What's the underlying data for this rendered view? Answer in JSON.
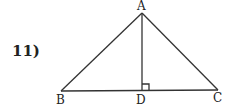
{
  "problem_number": "11)",
  "diagram": {
    "points": {
      "A": {
        "label": "A",
        "x": 142,
        "y": 13
      },
      "B": {
        "label": "B",
        "x": 61,
        "y": 91
      },
      "C": {
        "label": "C",
        "x": 218,
        "y": 90
      },
      "D": {
        "label": "D",
        "x": 142,
        "y": 91
      }
    },
    "segments": [
      "AB",
      "AC",
      "BC",
      "AD"
    ],
    "right_angle_at": "D",
    "stroke_color": "#333333"
  }
}
